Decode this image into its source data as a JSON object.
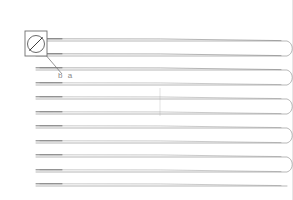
{
  "document": {
    "title": "Serpentine Toolpath Drawing",
    "background_color": "#ffffff",
    "width": 293,
    "height": 200,
    "border_color": "#e6e6e6"
  },
  "callout": {
    "name": "detail-callout",
    "box": {
      "x": 25,
      "y": 31,
      "width": 22,
      "height": 25
    },
    "box_stroke": "#6e6e6e",
    "symbol": "circle-slash",
    "symbol_label": "⊘",
    "circle": {
      "cx": 36,
      "cy": 44,
      "r": 8.5
    },
    "circle_stroke": "#585858",
    "slash_stroke": "#3c3c3c"
  },
  "leader": {
    "name": "leader-line",
    "from": {
      "x": 38,
      "y": 46
    },
    "to": {
      "x": 62,
      "y": 74
    },
    "stroke": "#7a7a7a"
  },
  "annotation": {
    "name": "dimension-label",
    "text": "b a",
    "x": 58,
    "y": 78,
    "color": "#8a8a8a",
    "font_size": 8
  },
  "guide": {
    "name": "vertical-guide",
    "x": 160,
    "y1": 88,
    "y2": 116,
    "stroke": "#dcdcdc"
  },
  "path": {
    "name": "serpentine-toolpath",
    "stroke": "#9a9a9a",
    "stroke_width": 0.7,
    "left_x": 36,
    "right_x": 287,
    "turn_control_x": 292,
    "rows": [
      41,
      56,
      70,
      85,
      99,
      114,
      128,
      143,
      157,
      172,
      186
    ],
    "pass_count": 11,
    "turn_side": "right",
    "accent_stroke": "#6a6a6a"
  },
  "legend": {
    "units": "",
    "scale": ""
  }
}
